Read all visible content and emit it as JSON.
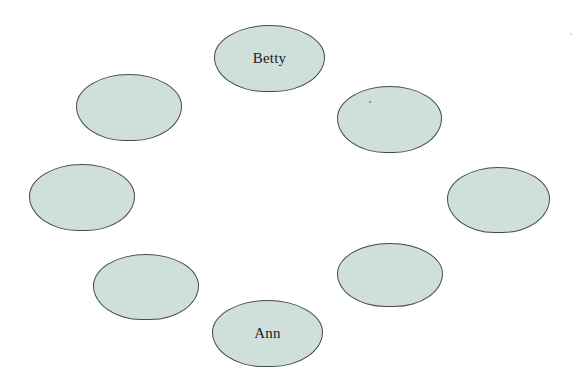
{
  "diagram": {
    "type": "seating-arrangement",
    "fill_color": "#cfdfdc",
    "stroke_color": "#4a4a4a",
    "seats": [
      {
        "id": "top",
        "label": "Betty",
        "x": 214,
        "y": 25,
        "w": 111,
        "h": 67
      },
      {
        "id": "upper-right",
        "label": "",
        "x": 337,
        "y": 86,
        "w": 105,
        "h": 67
      },
      {
        "id": "right",
        "label": "",
        "x": 447,
        "y": 167,
        "w": 103,
        "h": 66
      },
      {
        "id": "lower-right",
        "label": "",
        "x": 337,
        "y": 243,
        "w": 106,
        "h": 64
      },
      {
        "id": "bottom",
        "label": "Ann",
        "x": 212,
        "y": 300,
        "w": 111,
        "h": 67
      },
      {
        "id": "lower-left",
        "label": "",
        "x": 93,
        "y": 254,
        "w": 106,
        "h": 66
      },
      {
        "id": "left",
        "label": "",
        "x": 29,
        "y": 164,
        "w": 106,
        "h": 67
      },
      {
        "id": "upper-left",
        "label": "",
        "x": 76,
        "y": 74,
        "w": 106,
        "h": 67
      }
    ]
  }
}
